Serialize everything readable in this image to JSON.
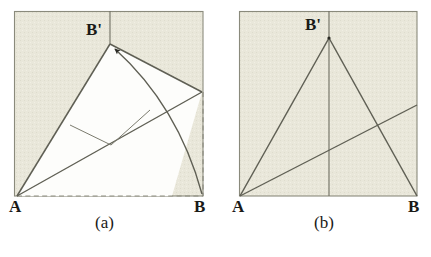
{
  "figure": {
    "colors": {
      "paper_shade": "#e9e7da",
      "paper_white": "#fdfdfb",
      "stroke": "#6e6e62",
      "ink": "#1a1a17",
      "background": "#ffffff"
    },
    "panels": [
      {
        "id": "a",
        "caption": "(a)",
        "square": {
          "left": 14,
          "top": 11,
          "right": 203,
          "bottom": 196
        },
        "points": [
          {
            "name": "A",
            "label": "A",
            "x": 17,
            "y": 196
          },
          {
            "name": "B",
            "label": "B",
            "x": 203,
            "y": 196
          },
          {
            "name": "B-prime",
            "label": "B'",
            "x": 110,
            "y": 44
          },
          {
            "name": "right-edge-vertex",
            "label": "",
            "x": 202,
            "y": 92
          }
        ],
        "solid_lines": [
          {
            "name": "crease-A-to-Bprime",
            "from": [
              17,
              196
            ],
            "to": [
              110,
              44
            ]
          },
          {
            "name": "fold-edge-Bprime-to-right",
            "from": [
              110,
              44
            ],
            "to": [
              202,
              92
            ]
          },
          {
            "name": "crease-A-to-right-edge",
            "from": [
              17,
              196
            ],
            "to": [
              202,
              92
            ]
          },
          {
            "name": "vertical-top-to-Bprime",
            "from": [
              110,
              11
            ],
            "to": [
              110,
              44
            ]
          },
          {
            "name": "small-crease-upper",
            "from": [
              70,
              125
            ],
            "to": [
              110,
              144
            ]
          },
          {
            "name": "small-crease-lower",
            "from": [
              110,
              144
            ],
            "to": [
              150,
              110
            ]
          }
        ],
        "dashed_lines": [
          {
            "name": "base-A-to-B",
            "from": [
              17,
              196
            ],
            "to": [
              203,
              196
            ]
          },
          {
            "name": "right-edge-to-B",
            "from": [
              203,
              92
            ],
            "to": [
              203,
              196
            ]
          }
        ],
        "arc": {
          "name": "fold-motion-arc",
          "from": [
            203,
            196
          ],
          "to": [
            113,
            47
          ],
          "control": [
            173,
            100
          ],
          "arrow_at": "B-prime"
        },
        "white_region": [
          [
            17,
            196
          ],
          [
            110,
            44
          ],
          [
            202,
            92
          ]
        ]
      },
      {
        "id": "b",
        "caption": "(b)",
        "square": {
          "left": 239,
          "top": 11,
          "right": 417,
          "bottom": 196
        },
        "points": [
          {
            "name": "A",
            "label": "A",
            "x": 240,
            "y": 196
          },
          {
            "name": "B",
            "label": "B",
            "x": 417,
            "y": 196
          },
          {
            "name": "B-prime",
            "label": "B'",
            "x": 329,
            "y": 38
          }
        ],
        "solid_lines": [
          {
            "name": "crease-A-to-Bprime",
            "from": [
              240,
              196
            ],
            "to": [
              329,
              38
            ]
          },
          {
            "name": "crease-Bprime-to-B",
            "from": [
              329,
              38
            ],
            "to": [
              417,
              196
            ]
          },
          {
            "name": "crease-A-to-right-edge",
            "from": [
              240,
              196
            ],
            "to": [
              417,
              105
            ]
          },
          {
            "name": "vertical-midline",
            "from": [
              329,
              11
            ],
            "to": [
              329,
              196
            ]
          }
        ],
        "dashed_lines": [],
        "arc": null,
        "white_region": null
      }
    ]
  }
}
